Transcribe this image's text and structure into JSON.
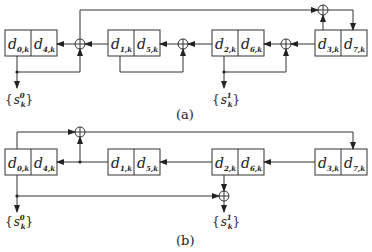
{
  "panels": [
    {
      "caption": "(a)",
      "registers": [
        {
          "left": {
            "base": "d",
            "sub": "0,k"
          },
          "right": {
            "base": "d",
            "sub": "4,k"
          }
        },
        {
          "left": {
            "base": "d",
            "sub": "1,k"
          },
          "right": {
            "base": "d",
            "sub": "5,k"
          }
        },
        {
          "left": {
            "base": "d",
            "sub": "2,k"
          },
          "right": {
            "base": "d",
            "sub": "6,k"
          }
        },
        {
          "left": {
            "base": "d",
            "sub": "3,k"
          },
          "right": {
            "base": "d",
            "sub": "7,k"
          }
        }
      ],
      "outputs": [
        {
          "open": "{",
          "base": "s",
          "sup": "0",
          "sub": "k",
          "close": "}"
        },
        {
          "open": "{",
          "base": "s",
          "sup": "1",
          "sub": "k",
          "close": "}"
        }
      ]
    },
    {
      "caption": "(b)",
      "registers": [
        {
          "left": {
            "base": "d",
            "sub": "0,k"
          },
          "right": {
            "base": "d",
            "sub": "4,k"
          }
        },
        {
          "left": {
            "base": "d",
            "sub": "1,k"
          },
          "right": {
            "base": "d",
            "sub": "5,k"
          }
        },
        {
          "left": {
            "base": "d",
            "sub": "2,k"
          },
          "right": {
            "base": "d",
            "sub": "6,k"
          }
        },
        {
          "left": {
            "base": "d",
            "sub": "3,k"
          },
          "right": {
            "base": "d",
            "sub": "7,k"
          }
        }
      ],
      "outputs": [
        {
          "open": "{",
          "base": "s",
          "sup": "0",
          "sub": "k",
          "close": "}"
        },
        {
          "open": "{",
          "base": "s",
          "sup": "1",
          "sub": "k",
          "close": "}"
        }
      ]
    }
  ]
}
